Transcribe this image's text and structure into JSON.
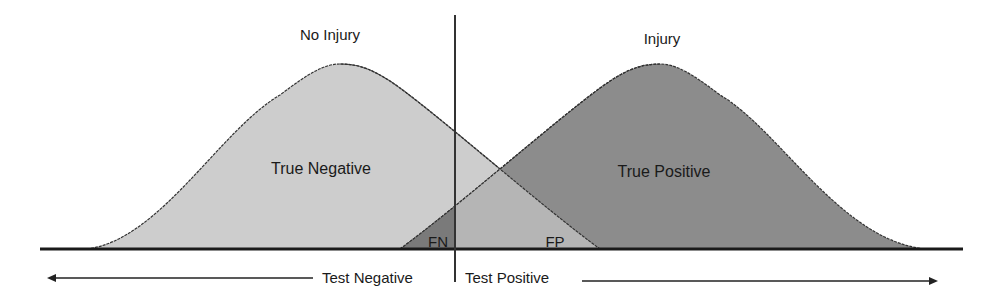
{
  "diagram": {
    "title_left": "No Injury",
    "title_right": "Injury",
    "region_true_negative": "True Negative",
    "region_true_positive": "True Positive",
    "region_false_negative": "FN",
    "region_false_positive": "FP",
    "axis_label_left": "Test Negative",
    "axis_label_right": "Test Positive"
  },
  "colors": {
    "no_injury_fill": "#cdcdcd",
    "injury_fill": "#8c8c8c",
    "overlap_fill": "#b5b5b5",
    "fn_fill": "#7a7a7a",
    "line": "#222222"
  }
}
